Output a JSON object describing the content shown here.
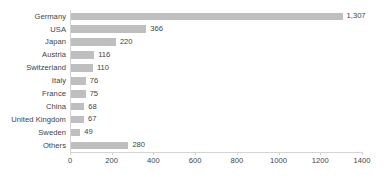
{
  "chart_data": {
    "type": "bar",
    "orientation": "horizontal",
    "title": "",
    "subtitle": "",
    "xlabel": "",
    "ylabel": "",
    "xlim": [
      0,
      1400
    ],
    "xtick_step": 200,
    "xticks": [
      "0",
      "200",
      "400",
      "600",
      "800",
      "1000",
      "1200",
      "1400"
    ],
    "grid": false,
    "legend": "none",
    "bar_color": "#bfbfbf",
    "axis_color": "#d4d4d4",
    "text_color": "#3f3f3f",
    "categories": [
      "Germany",
      "USA",
      "Japan",
      "Austria",
      "Switzerland",
      "Italy",
      "France",
      "China",
      "United Kingdom",
      "Sweden",
      "Others"
    ],
    "values": [
      1307,
      366,
      220,
      116,
      110,
      76,
      75,
      68,
      67,
      49,
      280
    ],
    "data_labels": [
      "1,307",
      "366",
      "220",
      "116",
      "110",
      "76",
      "75",
      "68",
      "67",
      "49",
      "280"
    ],
    "bars": [
      {
        "category": "Germany",
        "value": 1307,
        "label": "1,307"
      },
      {
        "category": "USA",
        "value": 366,
        "label": "366"
      },
      {
        "category": "Japan",
        "value": 220,
        "label": "220"
      },
      {
        "category": "Austria",
        "value": 116,
        "label": "116"
      },
      {
        "category": "Switzerland",
        "value": 110,
        "label": "110"
      },
      {
        "category": "Italy",
        "value": 76,
        "label": "76"
      },
      {
        "category": "France",
        "value": 75,
        "label": "75"
      },
      {
        "category": "China",
        "value": 68,
        "label": "68"
      },
      {
        "category": "United Kingdom",
        "value": 67,
        "label": "67"
      },
      {
        "category": "Sweden",
        "value": 49,
        "label": "49"
      },
      {
        "category": "Others",
        "value": 280,
        "label": "280"
      }
    ]
  }
}
